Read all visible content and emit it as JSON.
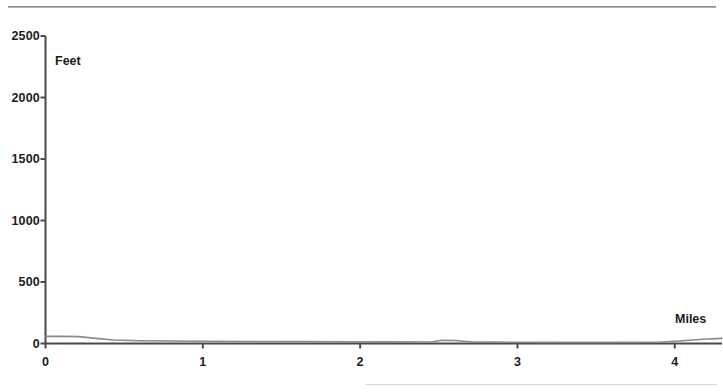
{
  "chart_data": {
    "type": "line",
    "title": "",
    "subtitle": "",
    "xlabel": "Miles",
    "ylabel": "Feet",
    "xlim": [
      0,
      4.3
    ],
    "ylim": [
      0,
      2500
    ],
    "grid": false,
    "legend": null,
    "x_ticks": [
      "0",
      "1",
      "2",
      "3",
      "4"
    ],
    "x_tick_values": [
      0,
      1,
      2,
      3,
      4
    ],
    "y_ticks": [
      "0",
      "500",
      "1000",
      "1500",
      "2000",
      "2500"
    ],
    "y_tick_values": [
      0,
      500,
      1000,
      1500,
      2000,
      2500
    ],
    "series": [
      {
        "name": "Elevation profile",
        "color": "#8a8a8a",
        "x": [
          0.0,
          0.1,
          0.21,
          0.32,
          0.43,
          0.6,
          0.8,
          1.0,
          1.3,
          1.6,
          1.9,
          2.2,
          2.45,
          2.52,
          2.6,
          2.72,
          2.85,
          3.0,
          3.3,
          3.6,
          3.9,
          4.05,
          4.18,
          4.3
        ],
        "values": [
          58,
          58,
          56,
          42,
          28,
          22,
          20,
          18,
          16,
          15,
          14,
          13,
          12,
          26,
          24,
          12,
          11,
          10,
          9,
          9,
          10,
          22,
          34,
          42
        ]
      },
      {
        "name": "Baseline",
        "color": "#4a4a4a",
        "x": [
          0.0,
          1.0,
          2.0,
          3.0,
          4.0,
          4.3
        ],
        "values": [
          0,
          0,
          0,
          0,
          0,
          0
        ]
      }
    ],
    "annotations": []
  },
  "axis": {
    "y_title": "Feet",
    "x_title": "Miles"
  },
  "colors": {
    "axis": "#4a4a4a",
    "line": "#8a8a8a",
    "text": "#1c1c1c",
    "rule": "#9a9a9a",
    "background": "#ffffff"
  }
}
